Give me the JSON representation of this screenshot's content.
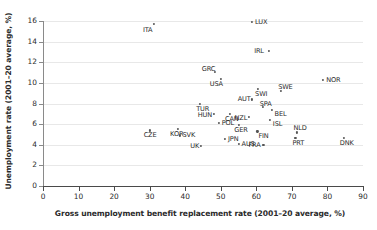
{
  "chart_data": {
    "type": "scatter",
    "title": "",
    "xlabel": "Gross unemployment benefit replacement rate (2001–20 average, %)",
    "ylabel": "Unemployment rate (2001–20 average, %)",
    "xlim": [
      0,
      90
    ],
    "ylim": [
      0,
      16
    ],
    "xticks": [
      "0",
      "10",
      "20",
      "30",
      "40",
      "50",
      "60",
      "70",
      "80",
      "90"
    ],
    "yticks": [
      "0",
      "2",
      "4",
      "6",
      "8",
      "10",
      "12",
      "14",
      "16"
    ],
    "grid": true,
    "legend": "none",
    "points": [
      {
        "label": "ITA",
        "x": 31.2,
        "y": 15.7,
        "lx": -11,
        "ly": 3
      },
      {
        "label": "LUX",
        "x": 58.8,
        "y": 15.9,
        "lx": 3,
        "ly": -3
      },
      {
        "label": "IRL",
        "x": 63.6,
        "y": 13.1,
        "lx": -15,
        "ly": -3
      },
      {
        "label": "GRC",
        "x": 48.3,
        "y": 11.1,
        "lx": -13,
        "ly": -6
      },
      {
        "label": "USA",
        "x": 50.0,
        "y": 10.4,
        "lx": -11,
        "ly": 2
      },
      {
        "label": "NOR",
        "x": 78.8,
        "y": 10.3,
        "lx": 3,
        "ly": -3
      },
      {
        "label": "SWE",
        "x": 67.0,
        "y": 9.2,
        "lx": -3,
        "ly": -7
      },
      {
        "label": "SWI",
        "x": 60.5,
        "y": 9.4,
        "lx": -3,
        "ly": 2
      },
      {
        "label": "AUT",
        "x": 58.7,
        "y": 8.4,
        "lx": -14,
        "ly": -3
      },
      {
        "label": "TUR",
        "x": 44.2,
        "y": 8.0,
        "lx": -4,
        "ly": 2
      },
      {
        "label": "SPA",
        "x": 61.8,
        "y": 7.7,
        "lx": -3,
        "ly": -6
      },
      {
        "label": "BEL",
        "x": 64.3,
        "y": 7.4,
        "lx": 3,
        "ly": 1
      },
      {
        "label": "HUN",
        "x": 48.0,
        "y": 7.0,
        "lx": -16,
        "ly": -2
      },
      {
        "label": "CAN",
        "x": 52.6,
        "y": 7.0,
        "lx": -5,
        "ly": 2
      },
      {
        "label": "NZL",
        "x": 57.8,
        "y": 6.7,
        "lx": -14,
        "ly": -2
      },
      {
        "label": "ISL",
        "x": 63.8,
        "y": 6.4,
        "lx": 3,
        "ly": 1
      },
      {
        "label": "POL",
        "x": 49.4,
        "y": 6.1,
        "lx": 3,
        "ly": -3
      },
      {
        "label": "GER",
        "x": 55.2,
        "y": 5.9,
        "lx": -5,
        "ly": 2
      },
      {
        "label": "FIN",
        "x": 60.3,
        "y": 5.3,
        "lx": 1,
        "ly": 2
      },
      {
        "label": "NLD",
        "x": 71.3,
        "y": 5.2,
        "lx": -3,
        "ly": -7
      },
      {
        "label": "CZE",
        "x": 30.0,
        "y": 5.4,
        "lx": -6,
        "ly": 2
      },
      {
        "label": "KOR",
        "x": 38.0,
        "y": 5.5,
        "lx": -8,
        "ly": 2
      },
      {
        "label": "SVK",
        "x": 38.4,
        "y": 4.9,
        "lx": 3,
        "ly": -3
      },
      {
        "label": "PRT",
        "x": 71.0,
        "y": 4.7,
        "lx": -3,
        "ly": 2
      },
      {
        "label": "DNK",
        "x": 84.6,
        "y": 4.7,
        "lx": -4,
        "ly": 2
      },
      {
        "label": "JPN",
        "x": 51.2,
        "y": 4.6,
        "lx": 3,
        "ly": -3
      },
      {
        "label": "AUS",
        "x": 55.0,
        "y": 4.1,
        "lx": 3,
        "ly": -3
      },
      {
        "label": "FRA",
        "x": 62.0,
        "y": 4.0,
        "lx": -15,
        "ly": -3
      },
      {
        "label": "UK",
        "x": 44.5,
        "y": 3.9,
        "lx": -11,
        "ly": -3
      }
    ]
  }
}
